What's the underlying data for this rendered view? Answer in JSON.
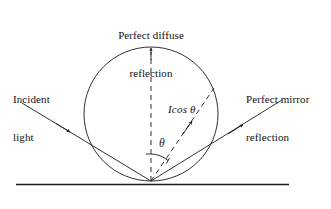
{
  "figure": {
    "labels": {
      "diffuse_line1": "Perfect diffuse",
      "diffuse_line2": "reflection",
      "incident_line1": "Incident",
      "incident_line2": "light",
      "mirror_line1": "Perfect mirror",
      "mirror_line2": "reflection",
      "i_cos_theta": "Icos θ",
      "theta": "θ"
    },
    "colors": {
      "stroke": "#1a1a1a",
      "background": "#ffffff"
    },
    "geometry": {
      "circle_center_x": 151,
      "circle_center_y": 114,
      "circle_radius": 67,
      "ground_y": 184,
      "ground_x_start": 16,
      "ground_x_end": 289,
      "tangent_point_x": 151,
      "tangent_point_y": 181,
      "incident_start_x": 22,
      "incident_start_y": 103,
      "mirror_end_x": 282,
      "mirror_end_y": 100,
      "normal_top_y": 47,
      "theta_degrees": 38
    }
  }
}
